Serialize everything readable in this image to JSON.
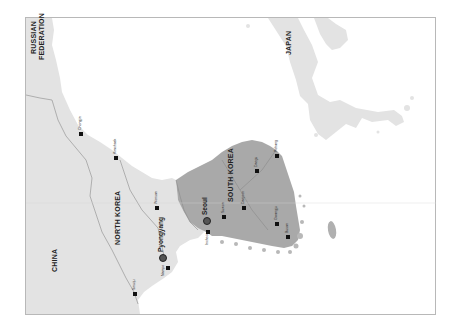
{
  "map": {
    "orientation": "rotated 90° counter-clockwise",
    "colors": {
      "land": "#e3e3e3",
      "south_korea": "#a9a9a9",
      "water": "#ffffff",
      "border": "#8a8a8a",
      "frame": "#b8b8b8"
    },
    "countries": [
      {
        "id": "russia",
        "label": "RUSSIAN"
      },
      {
        "id": "russia2",
        "label": "FEDERATION"
      },
      {
        "id": "china",
        "label": "CHINA"
      },
      {
        "id": "north_korea",
        "label": "NORTH KOREA"
      },
      {
        "id": "south_korea",
        "label": "SOUTH KOREA"
      },
      {
        "id": "japan",
        "label": "JAPAN"
      }
    ],
    "capitals": [
      {
        "name": "Pyongyang"
      },
      {
        "name": "Seoul"
      }
    ],
    "cities": [
      {
        "name": "Chongjin"
      },
      {
        "name": "Kimchaek"
      },
      {
        "name": "Wonsan"
      },
      {
        "name": "Nampo"
      },
      {
        "name": "Sinuiju"
      },
      {
        "name": "Incheon"
      },
      {
        "name": "Suwon"
      },
      {
        "name": "Daejeon"
      },
      {
        "name": "Daegu"
      },
      {
        "name": "Pohang"
      },
      {
        "name": "Gwangju"
      },
      {
        "name": "Busan"
      }
    ]
  }
}
